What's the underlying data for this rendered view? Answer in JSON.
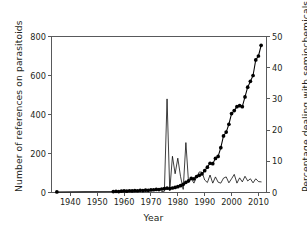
{
  "chart_data": {
    "type": "line",
    "title": "",
    "xlabel": "Year",
    "ylabel": "Number of references on parasitoids",
    "y2label": "Percentage dealing with semiochemicals",
    "xlim": [
      1933,
      2013
    ],
    "ylim": [
      0,
      800
    ],
    "y2lim": [
      0,
      50
    ],
    "grid": false,
    "legend": "none",
    "xticks": [
      1940,
      1950,
      1960,
      1970,
      1980,
      1990,
      2000,
      2010
    ],
    "xtick_labels": [
      "1940",
      "1950",
      "1960",
      "1970",
      "1980",
      "1990",
      "2000",
      "2010"
    ],
    "yticks": [
      0,
      200,
      400,
      600,
      800
    ],
    "ytick_labels": [
      "0",
      "200",
      "400",
      "600",
      "800"
    ],
    "y2ticks": [
      0,
      10,
      20,
      30,
      40,
      50
    ],
    "y2tick_labels": [
      "0",
      "10",
      "20",
      "30",
      "40",
      "50"
    ],
    "series": [
      {
        "name": "Number of references on parasitoids",
        "axis": "left",
        "marker": "filled-circle",
        "x": [
          1935,
          1956,
          1957,
          1958,
          1959,
          1960,
          1961,
          1962,
          1963,
          1964,
          1965,
          1966,
          1967,
          1968,
          1969,
          1970,
          1971,
          1972,
          1973,
          1974,
          1975,
          1976,
          1977,
          1978,
          1979,
          1980,
          1981,
          1982,
          1983,
          1984,
          1985,
          1986,
          1987,
          1988,
          1989,
          1990,
          1991,
          1992,
          1993,
          1994,
          1995,
          1996,
          1997,
          1998,
          1999,
          2000,
          2001,
          2002,
          2003,
          2004,
          2005,
          2006,
          2007,
          2008,
          2009,
          2010,
          2011
        ],
        "values": [
          3,
          5,
          6,
          5,
          7,
          8,
          7,
          9,
          8,
          10,
          9,
          11,
          10,
          12,
          11,
          13,
          14,
          16,
          15,
          18,
          20,
          22,
          20,
          23,
          26,
          30,
          35,
          42,
          52,
          60,
          72,
          70,
          82,
          88,
          96,
          112,
          130,
          150,
          148,
          175,
          185,
          230,
          290,
          310,
          350,
          405,
          420,
          440,
          445,
          440,
          490,
          540,
          570,
          600,
          680,
          700,
          755
        ]
      },
      {
        "name": "Percentage dealing with semiochemicals",
        "axis": "right",
        "marker": "none",
        "x": [
          1974,
          1975,
          1976,
          1977,
          1978,
          1979,
          1980,
          1981,
          1982,
          1983,
          1984,
          1985,
          1986,
          1987,
          1988,
          1989,
          1990,
          1991,
          1992,
          1993,
          1994,
          1995,
          1996,
          1997,
          1998,
          1999,
          2000,
          2001,
          2002,
          2003,
          2004,
          2005,
          2006,
          2007,
          2008,
          2009,
          2010,
          2011
        ],
        "values": [
          0.3,
          0.4,
          30.0,
          0.6,
          11.6,
          6.0,
          11.0,
          5.2,
          1.0,
          16.0,
          3.2,
          4.4,
          3.0,
          5.0,
          6.6,
          6.5,
          4.0,
          3.2,
          5.6,
          3.0,
          5.0,
          3.3,
          3.0,
          4.6,
          5.0,
          3.1,
          4.4,
          5.8,
          3.0,
          4.7,
          3.4,
          5.2,
          3.7,
          4.4,
          3.1,
          4.4,
          3.5,
          3.4
        ]
      }
    ]
  },
  "axes": {
    "x_title": "Year",
    "y_left_title": "Number of references on parasitoids",
    "y_right_title": "Percentage dealing with semiochemicals"
  }
}
